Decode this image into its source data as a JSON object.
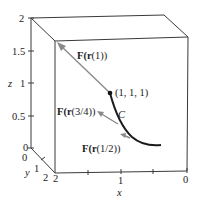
{
  "figure": {
    "type": "3d-vector-field-along-curve",
    "box": {
      "x_range": [
        0,
        2
      ],
      "y_range": [
        0,
        2
      ],
      "z_range": [
        0,
        2
      ]
    },
    "axes": {
      "z": {
        "label": "z",
        "ticks": [
          "0",
          "0.5",
          "1",
          "1.5",
          "2"
        ]
      },
      "y": {
        "label": "y",
        "ticks": [
          "0",
          "1",
          "2"
        ]
      },
      "x": {
        "label": "x",
        "ticks": [
          "2",
          "1",
          "0"
        ]
      }
    },
    "curve": {
      "label": "C",
      "color": "#1a1a1a"
    },
    "point": {
      "label": "(1, 1, 1)"
    },
    "vectors": [
      {
        "label_prefix": "F(",
        "label_r": "r",
        "label_arg": "(1))",
        "name": "F(r(1))",
        "color": "#8a8a8a"
      },
      {
        "label_prefix": "F(",
        "label_r": "r",
        "label_arg": "(3/4))",
        "name": "F(r(3/4))",
        "color": "#8a8a8a"
      },
      {
        "label_prefix": "F(",
        "label_r": "r",
        "label_arg": "(1/2))",
        "name": "F(r(1/2))",
        "color": "#8a8a8a"
      }
    ]
  }
}
